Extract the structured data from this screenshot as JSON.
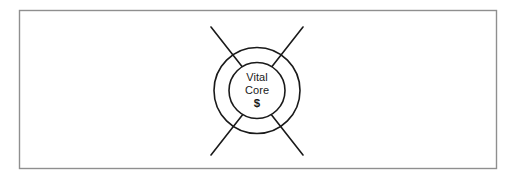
{
  "diagram": {
    "frame": {
      "name": "outer-frame",
      "stroke_color": "#8f8f8f",
      "background_color": "#ffffff"
    },
    "core": {
      "line_1": "Vital",
      "line_2": "Core",
      "line_3": "$",
      "text_color": "#1a1a1a"
    },
    "circles": {
      "outer": {
        "label": "outer-ring",
        "stroke_color": "#1a1a1a"
      },
      "inner": {
        "label": "inner-core-circle",
        "stroke_color": "#1a1a1a"
      }
    },
    "spokes": {
      "count": "4",
      "stroke_color": "#1a1a1a",
      "items": [
        {
          "label": "spoke-top-left"
        },
        {
          "label": "spoke-top-right"
        },
        {
          "label": "spoke-bottom-left"
        },
        {
          "label": "spoke-bottom-right"
        }
      ]
    }
  }
}
